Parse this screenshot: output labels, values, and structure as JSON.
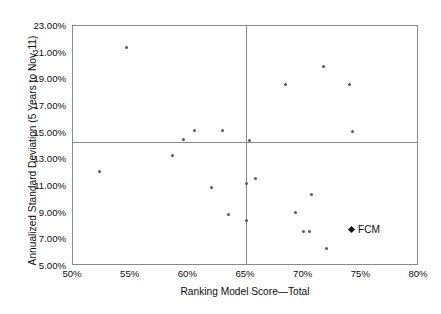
{
  "chart_data": {
    "type": "scatter",
    "title": "",
    "xlabel": "Ranking Model Score—Total",
    "ylabel": "Annualized Standard Deviation (5 Years to Nov-11)",
    "xlim": [
      50,
      80
    ],
    "ylim": [
      5,
      23
    ],
    "x_tick_labels": [
      "50%",
      "55%",
      "60%",
      "65%",
      "70%",
      "75%",
      "80%"
    ],
    "x_ticks": [
      50,
      55,
      60,
      65,
      70,
      75,
      80
    ],
    "y_tick_labels": [
      "5.00%",
      "7.00%",
      "9.00%",
      "11.00%",
      "13.00%",
      "15.00%",
      "17.00%",
      "19.00%",
      "21.00%",
      "23.00%"
    ],
    "y_ticks": [
      5,
      7,
      9,
      11,
      13,
      15,
      17,
      19,
      21,
      23
    ],
    "grid": false,
    "legend_position": "inside-right",
    "reference_lines": [
      {
        "orientation": "vertical",
        "value": 65
      },
      {
        "orientation": "horizontal",
        "value": 14.3
      }
    ],
    "series": [
      {
        "name": "Peer funds",
        "marker": "dot",
        "color": "#555b66",
        "points": [
          {
            "x": 54.6,
            "y": 21.4
          },
          {
            "x": 52.3,
            "y": 12.1
          },
          {
            "x": 58.6,
            "y": 13.3
          },
          {
            "x": 59.6,
            "y": 14.5
          },
          {
            "x": 60.5,
            "y": 15.2
          },
          {
            "x": 62.0,
            "y": 10.9
          },
          {
            "x": 63.0,
            "y": 15.2
          },
          {
            "x": 63.5,
            "y": 8.9
          },
          {
            "x": 65.0,
            "y": 11.2
          },
          {
            "x": 65.0,
            "y": 8.4
          },
          {
            "x": 65.8,
            "y": 11.6
          },
          {
            "x": 65.3,
            "y": 14.4
          },
          {
            "x": 68.4,
            "y": 18.6
          },
          {
            "x": 69.3,
            "y": 9.0
          },
          {
            "x": 70.0,
            "y": 7.6
          },
          {
            "x": 70.5,
            "y": 7.6
          },
          {
            "x": 70.7,
            "y": 10.4
          },
          {
            "x": 71.7,
            "y": 20.0
          },
          {
            "x": 72.0,
            "y": 6.3
          },
          {
            "x": 74.0,
            "y": 18.6
          },
          {
            "x": 74.2,
            "y": 15.1
          }
        ]
      },
      {
        "name": "FCM",
        "marker": "diamond",
        "color": "#111111",
        "legend_only": true,
        "points": []
      }
    ],
    "legend": [
      {
        "label": "FCM",
        "marker": "diamond",
        "color": "#111111"
      }
    ]
  },
  "legend": {
    "fcm_label": "FCM"
  },
  "axes": {
    "x_title": "Ranking Model Score—Total",
    "y_title": "Annualized Standard Deviation (5 Years to Nov-11)"
  }
}
